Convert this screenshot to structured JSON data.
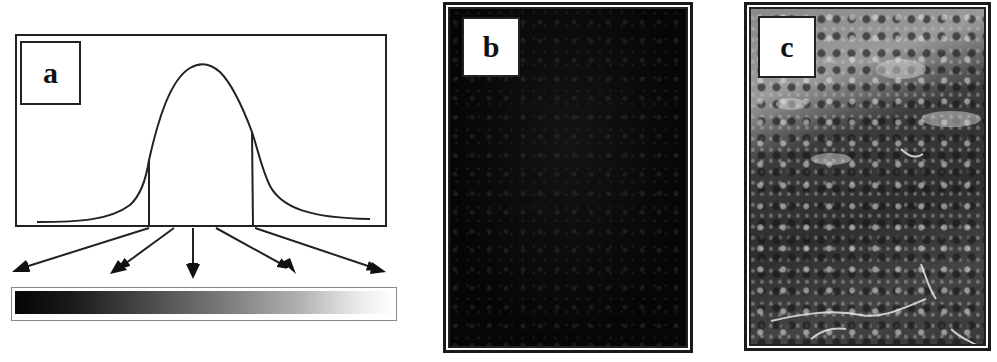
{
  "figure": {
    "panels": [
      {
        "id": "a",
        "label": "a",
        "description": "Normal distribution curve of pixel values with two vertical cut lines; five arrows map histogram ranges onto a black-to-white grayscale bar",
        "curve": {
          "type": "gaussian",
          "peak_x": 203,
          "peak_y": 66,
          "baseline_y": 222,
          "left_cut_x": 149,
          "right_cut_x": 252
        },
        "arrows": [
          {
            "from": [
              149,
              228
            ],
            "to": [
              12,
              270
            ]
          },
          {
            "from": [
              174,
              228
            ],
            "to": [
              113,
              272
            ]
          },
          {
            "from": [
              193,
              228
            ],
            "to": [
              193,
              278
            ]
          },
          {
            "from": [
              216,
              228
            ],
            "to": [
              294,
              272
            ]
          },
          {
            "from": [
              254,
              228
            ],
            "to": [
              384,
              272
            ]
          }
        ],
        "grayscale_bar": {
          "start_color": "#050505",
          "end_color": "#ffffff"
        }
      },
      {
        "id": "b",
        "label": "b",
        "description": "Very dark satellite image (low contrast, before stretch)",
        "base_color": "#0a0a0a"
      },
      {
        "id": "c",
        "label": "c",
        "description": "Contrast-enhanced grayscale satellite image of mountainous terrain with bright river valleys",
        "base_color": "#555555"
      }
    ]
  }
}
